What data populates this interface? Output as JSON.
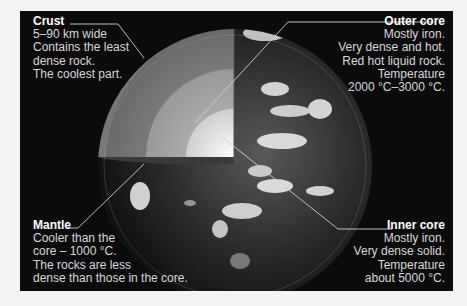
{
  "diagram": {
    "colors": {
      "background": "#0b0b0b",
      "text": "#d8d8d8",
      "title": "#ffffff",
      "page": "#f4f4f4"
    },
    "layers": {
      "crust": {
        "title": "Crust",
        "lines": [
          "5–90 km wide",
          "Contains the least",
          "dense rock.",
          "The coolest part."
        ]
      },
      "outer_core": {
        "title": "Outer core",
        "lines": [
          "Mostly iron.",
          "Very dense and hot.",
          "Red hot liquid rock.",
          "Temperature",
          "2000 °C–3000 °C."
        ]
      },
      "mantle": {
        "title": "Mantle",
        "lines": [
          "Cooler than the",
          "core – 1000 °C.",
          "The rocks are less",
          "dense than those in the core."
        ]
      },
      "inner_core": {
        "title": "Inner core",
        "lines": [
          "Mostly iron.",
          "Very dense solid.",
          "Temperature",
          "about 5000 °C."
        ]
      }
    }
  }
}
